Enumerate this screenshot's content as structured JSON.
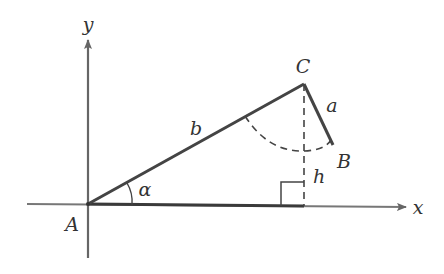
{
  "figure": {
    "type": "triangle-on-coordinate-axes",
    "colors": {
      "line": "#444444",
      "axis": "#666666",
      "label": "#333333",
      "background": "#ffffff"
    },
    "axes": {
      "x_label": "x",
      "y_label": "y"
    },
    "vertices": {
      "A": "A",
      "B": "B",
      "C": "C"
    },
    "sides": {
      "a": "a",
      "b": "b",
      "h": "h"
    },
    "angle": {
      "alpha": "α"
    }
  }
}
